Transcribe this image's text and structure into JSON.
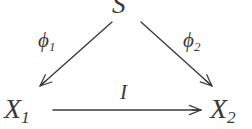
{
  "diagram": {
    "kind": "commutative-triangle",
    "ink_color": "#3a3a3a",
    "background_color": "#ffffff",
    "nodes": [
      {
        "id": "S",
        "label": "S",
        "sub": "",
        "x": 124,
        "y": 12,
        "role": "apex"
      },
      {
        "id": "X1",
        "label": "X",
        "sub": "1",
        "x": 22,
        "y": 110,
        "role": "source"
      },
      {
        "id": "X2",
        "label": "X",
        "sub": "2",
        "x": 228,
        "y": 110,
        "role": "target"
      }
    ],
    "edges": [
      {
        "id": "phi1",
        "from": "S",
        "to": "X1",
        "label": "ϕ",
        "sub": "1",
        "direction": "down-left",
        "arrowhead": "open-tip"
      },
      {
        "id": "phi2",
        "from": "S",
        "to": "X2",
        "label": "ϕ",
        "sub": "2",
        "direction": "down-right",
        "arrowhead": "open-tip"
      },
      {
        "id": "I",
        "from": "X1",
        "to": "X2",
        "label": "I",
        "sub": "",
        "direction": "right",
        "arrowhead": "open-tip"
      }
    ]
  }
}
